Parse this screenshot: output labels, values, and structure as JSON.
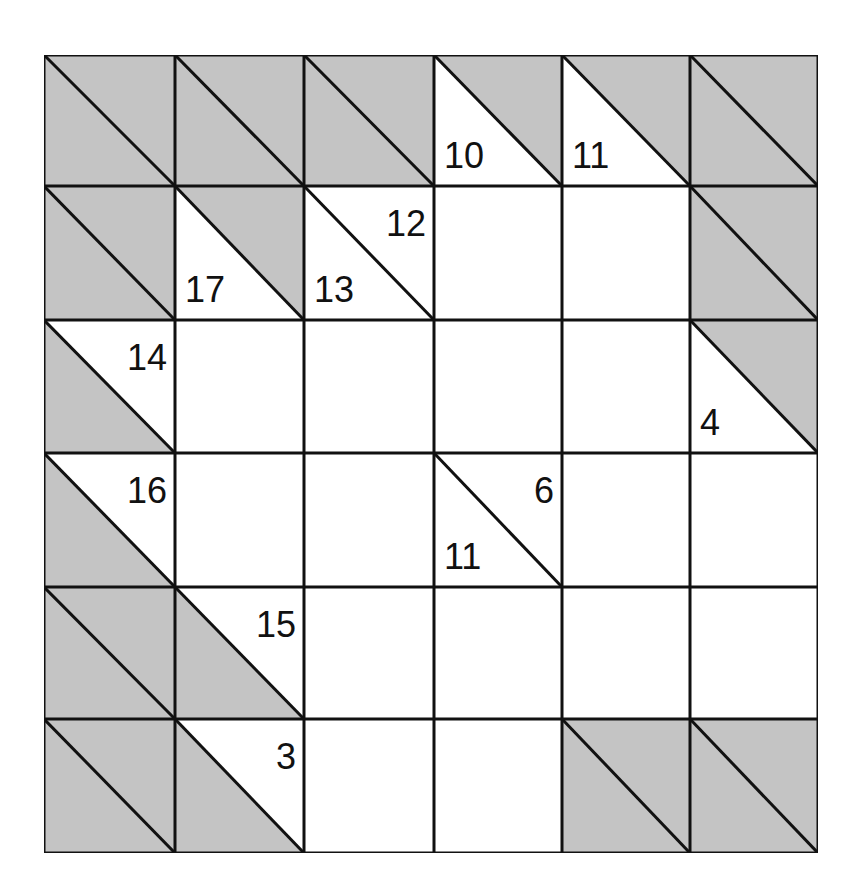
{
  "puzzle": {
    "type": "kakuro",
    "rows": 6,
    "cols": 6,
    "colors": {
      "shade": "#c4c4c4",
      "line": "#111111",
      "cell": "#ffffff"
    },
    "grid": [
      [
        {
          "kind": "block"
        },
        {
          "kind": "block"
        },
        {
          "kind": "block"
        },
        {
          "kind": "clue",
          "down": "10"
        },
        {
          "kind": "clue",
          "down": "11"
        },
        {
          "kind": "block"
        }
      ],
      [
        {
          "kind": "block"
        },
        {
          "kind": "clue",
          "down": "17"
        },
        {
          "kind": "clue",
          "down": "13",
          "right": "12"
        },
        {
          "kind": "entry",
          "value": ""
        },
        {
          "kind": "entry",
          "value": ""
        },
        {
          "kind": "block"
        }
      ],
      [
        {
          "kind": "clue",
          "right": "14"
        },
        {
          "kind": "entry",
          "value": ""
        },
        {
          "kind": "entry",
          "value": ""
        },
        {
          "kind": "entry",
          "value": ""
        },
        {
          "kind": "entry",
          "value": ""
        },
        {
          "kind": "clue",
          "down": "4"
        }
      ],
      [
        {
          "kind": "clue",
          "right": "16"
        },
        {
          "kind": "entry",
          "value": ""
        },
        {
          "kind": "entry",
          "value": ""
        },
        {
          "kind": "clue",
          "down": "11",
          "right": "6"
        },
        {
          "kind": "entry",
          "value": ""
        },
        {
          "kind": "entry",
          "value": ""
        }
      ],
      [
        {
          "kind": "block"
        },
        {
          "kind": "clue",
          "right": "15"
        },
        {
          "kind": "entry",
          "value": ""
        },
        {
          "kind": "entry",
          "value": ""
        },
        {
          "kind": "entry",
          "value": ""
        },
        {
          "kind": "entry",
          "value": ""
        }
      ],
      [
        {
          "kind": "block"
        },
        {
          "kind": "clue",
          "right": "3"
        },
        {
          "kind": "entry",
          "value": ""
        },
        {
          "kind": "entry",
          "value": ""
        },
        {
          "kind": "block"
        },
        {
          "kind": "block"
        }
      ]
    ]
  }
}
